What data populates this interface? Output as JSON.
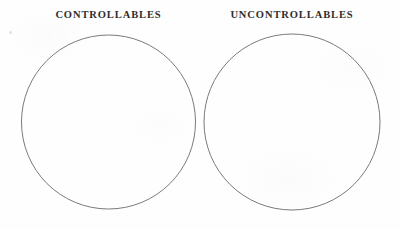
{
  "page": {
    "background_color": "#fefefe",
    "width": 400,
    "height": 229
  },
  "headings": {
    "left": "CONTROLLABLES",
    "right": "UNCONTROLLABLES"
  },
  "circles": [
    {
      "name": "controllables-circle",
      "label": "CONTROLLABLES",
      "center_x": 108.5,
      "center_y": 122,
      "radius": 87,
      "stroke_color": "#7a7a7a",
      "stroke_width": 1,
      "fill": "none",
      "contents": []
    },
    {
      "name": "uncontrollables-circle",
      "label": "UNCONTROLLABLES",
      "center_x": 292,
      "center_y": 122,
      "radius": 88,
      "stroke_color": "#7a7a7a",
      "stroke_width": 1,
      "fill": "none",
      "contents": []
    }
  ],
  "colors": {
    "text": "#2e2e2e",
    "stroke": "#7a7a7a",
    "background": "#fefefe"
  }
}
